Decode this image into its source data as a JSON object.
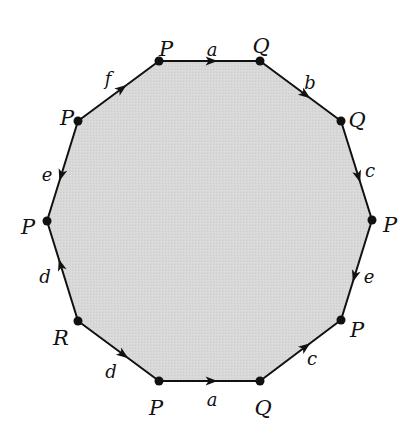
{
  "diagram": {
    "title": "",
    "type": "polygon-identification",
    "fill_color": "#d6d6d6",
    "stroke_color": "#111111",
    "vertices": [
      {
        "id": "v0",
        "label": "P",
        "x": 159,
        "y": 61,
        "lx": 166,
        "ly": 50
      },
      {
        "id": "v1",
        "label": "Q",
        "x": 260,
        "y": 61,
        "lx": 261,
        "ly": 47
      },
      {
        "id": "v2",
        "label": "Q",
        "x": 341,
        "y": 121,
        "lx": 357,
        "ly": 121
      },
      {
        "id": "v3",
        "label": "P",
        "x": 372,
        "y": 220,
        "lx": 390,
        "ly": 226
      },
      {
        "id": "v4",
        "label": "P",
        "x": 341,
        "y": 320,
        "lx": 357,
        "ly": 331
      },
      {
        "id": "v5",
        "label": "Q",
        "x": 260,
        "y": 381,
        "lx": 263,
        "ly": 409
      },
      {
        "id": "v6",
        "label": "P",
        "x": 159,
        "y": 381,
        "lx": 156,
        "ly": 409
      },
      {
        "id": "v7",
        "label": "R",
        "x": 78,
        "y": 321,
        "lx": 61,
        "ly": 339
      },
      {
        "id": "v8",
        "label": "P",
        "x": 47,
        "y": 221,
        "lx": 28,
        "ly": 228
      },
      {
        "id": "v9",
        "label": "P",
        "x": 78,
        "y": 121,
        "lx": 67,
        "ly": 119
      }
    ],
    "edges": [
      {
        "label": "a",
        "from": 0,
        "to": 1,
        "lx": 212,
        "ly": 51,
        "arrow_t": 0.58
      },
      {
        "label": "b",
        "from": 1,
        "to": 2,
        "lx": 310,
        "ly": 84,
        "arrow_t": 0.62
      },
      {
        "label": "c",
        "from": 2,
        "to": 3,
        "lx": 370,
        "ly": 172,
        "arrow_t": 0.62
      },
      {
        "label": "e",
        "from": 3,
        "to": 4,
        "lx": 369,
        "ly": 278,
        "arrow_t": 0.62
      },
      {
        "label": "c",
        "from": 5,
        "to": 4,
        "lx": 312,
        "ly": 360,
        "arrow_t": 0.62
      },
      {
        "label": "a",
        "from": 6,
        "to": 5,
        "lx": 212,
        "ly": 401,
        "arrow_t": 0.58
      },
      {
        "label": "d",
        "from": 7,
        "to": 6,
        "lx": 111,
        "ly": 373,
        "arrow_t": 0.62
      },
      {
        "label": "d",
        "from": 7,
        "to": 8,
        "lx": 45,
        "ly": 278,
        "arrow_t": 0.62
      },
      {
        "label": "e",
        "from": 9,
        "to": 8,
        "lx": 47,
        "ly": 176,
        "arrow_t": 0.6
      },
      {
        "label": "f",
        "from": 9,
        "to": 0,
        "lx": 108,
        "ly": 80,
        "arrow_t": 0.6
      }
    ]
  }
}
